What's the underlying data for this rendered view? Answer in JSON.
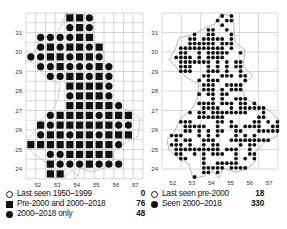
{
  "maps": [
    {
      "id": "left",
      "description": "Tetrad/10km grid occupancy map",
      "y_ticks": [
        "31",
        "30",
        "29",
        "28",
        "27",
        "26",
        "25",
        "24"
      ],
      "x_ticks": [
        "52",
        "53",
        "54",
        "55",
        "56",
        "57"
      ],
      "legend": [
        {
          "symbol": "open-circle",
          "label": "Last seen 1950–1999",
          "count": "0"
        },
        {
          "symbol": "square",
          "label": "Pre-2000 and 2000–2018",
          "count": "76"
        },
        {
          "symbol": "dot",
          "label": "2000–2018 only",
          "count": "48"
        }
      ],
      "cells": [
        [
          0,
          4,
          "s"
        ],
        [
          0,
          5,
          "s"
        ],
        [
          0,
          6,
          "d"
        ],
        [
          1,
          4,
          "d"
        ],
        [
          1,
          5,
          "s"
        ],
        [
          1,
          6,
          "d"
        ],
        [
          2,
          1,
          "d"
        ],
        [
          2,
          2,
          "d"
        ],
        [
          2,
          3,
          "d"
        ],
        [
          2,
          4,
          "d"
        ],
        [
          2,
          5,
          "s"
        ],
        [
          2,
          6,
          "s"
        ],
        [
          3,
          1,
          "d"
        ],
        [
          3,
          2,
          "s"
        ],
        [
          3,
          3,
          "d"
        ],
        [
          3,
          4,
          "s"
        ],
        [
          3,
          5,
          "s"
        ],
        [
          3,
          6,
          "d"
        ],
        [
          3,
          7,
          "s"
        ],
        [
          4,
          0,
          "d"
        ],
        [
          4,
          1,
          "d"
        ],
        [
          4,
          2,
          "s"
        ],
        [
          4,
          3,
          "s"
        ],
        [
          4,
          4,
          "d"
        ],
        [
          4,
          5,
          "s"
        ],
        [
          4,
          6,
          "s"
        ],
        [
          4,
          7,
          "d"
        ],
        [
          5,
          1,
          "d"
        ],
        [
          5,
          2,
          "d"
        ],
        [
          5,
          3,
          "s"
        ],
        [
          5,
          4,
          "d"
        ],
        [
          5,
          5,
          "d"
        ],
        [
          5,
          6,
          "d"
        ],
        [
          5,
          7,
          "s"
        ],
        [
          5,
          8,
          "d"
        ],
        [
          6,
          2,
          "d"
        ],
        [
          6,
          3,
          "d"
        ],
        [
          6,
          4,
          "s"
        ],
        [
          6,
          5,
          "s"
        ],
        [
          6,
          6,
          "d"
        ],
        [
          6,
          7,
          "s"
        ],
        [
          6,
          8,
          "d"
        ],
        [
          7,
          4,
          "s"
        ],
        [
          7,
          5,
          "s"
        ],
        [
          7,
          6,
          "s"
        ],
        [
          7,
          7,
          "s"
        ],
        [
          7,
          8,
          "d"
        ],
        [
          8,
          4,
          "d"
        ],
        [
          8,
          5,
          "s"
        ],
        [
          8,
          6,
          "s"
        ],
        [
          8,
          7,
          "s"
        ],
        [
          8,
          8,
          "d"
        ],
        [
          9,
          4,
          "s"
        ],
        [
          9,
          5,
          "s"
        ],
        [
          9,
          6,
          "s"
        ],
        [
          9,
          7,
          "s"
        ],
        [
          9,
          8,
          "s"
        ],
        [
          9,
          9,
          "d"
        ],
        [
          10,
          2,
          "d"
        ],
        [
          10,
          3,
          "s"
        ],
        [
          10,
          4,
          "s"
        ],
        [
          10,
          5,
          "s"
        ],
        [
          10,
          6,
          "s"
        ],
        [
          10,
          7,
          "d"
        ],
        [
          10,
          8,
          "s"
        ],
        [
          10,
          9,
          "s"
        ],
        [
          10,
          10,
          "s"
        ],
        [
          11,
          1,
          "s"
        ],
        [
          11,
          2,
          "d"
        ],
        [
          11,
          3,
          "s"
        ],
        [
          11,
          4,
          "s"
        ],
        [
          11,
          5,
          "s"
        ],
        [
          11,
          6,
          "s"
        ],
        [
          11,
          7,
          "s"
        ],
        [
          11,
          8,
          "s"
        ],
        [
          11,
          9,
          "d"
        ],
        [
          11,
          10,
          "d"
        ],
        [
          12,
          1,
          "d"
        ],
        [
          12,
          2,
          "s"
        ],
        [
          12,
          3,
          "s"
        ],
        [
          12,
          4,
          "d"
        ],
        [
          12,
          5,
          "s"
        ],
        [
          12,
          6,
          "s"
        ],
        [
          12,
          7,
          "d"
        ],
        [
          12,
          8,
          "s"
        ],
        [
          12,
          9,
          "s"
        ],
        [
          12,
          10,
          "s"
        ],
        [
          13,
          0,
          "s"
        ],
        [
          13,
          1,
          "s"
        ],
        [
          13,
          2,
          "s"
        ],
        [
          13,
          3,
          "s"
        ],
        [
          13,
          4,
          "s"
        ],
        [
          13,
          5,
          "s"
        ],
        [
          13,
          6,
          "s"
        ],
        [
          13,
          7,
          "s"
        ],
        [
          13,
          8,
          "s"
        ],
        [
          13,
          9,
          "d"
        ],
        [
          14,
          2,
          "d"
        ],
        [
          14,
          3,
          "d"
        ],
        [
          14,
          4,
          "s"
        ],
        [
          14,
          5,
          "s"
        ],
        [
          14,
          6,
          "s"
        ],
        [
          14,
          7,
          "s"
        ],
        [
          14,
          8,
          "s"
        ],
        [
          15,
          2,
          "s"
        ],
        [
          15,
          3,
          "d"
        ],
        [
          15,
          4,
          "d"
        ],
        [
          15,
          5,
          "d"
        ],
        [
          15,
          6,
          "s"
        ],
        [
          15,
          7,
          "d"
        ],
        [
          15,
          8,
          "d"
        ],
        [
          15,
          9,
          "d"
        ],
        [
          16,
          2,
          "s"
        ],
        [
          16,
          3,
          "s"
        ]
      ]
    },
    {
      "id": "right",
      "description": "Fine-resolution occurrence dot map",
      "y_ticks": [
        "31",
        "30",
        "29",
        "28",
        "27",
        "26",
        "25",
        "24"
      ],
      "x_ticks": [
        "52",
        "53",
        "54",
        "55",
        "56",
        "57"
      ],
      "legend": [
        {
          "symbol": "open-circle",
          "label": "Last seen pre-2000",
          "count": "18"
        },
        {
          "symbol": "dot",
          "label": "Seen 2000–2018",
          "count": "330"
        }
      ]
    }
  ],
  "colors": {
    "symbol": "#111111",
    "grid": "#bdbdbd",
    "outline": "#9a9a9a",
    "background": "#ffffff"
  }
}
